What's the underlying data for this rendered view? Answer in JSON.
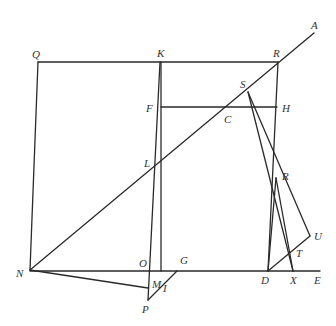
{
  "diagram": {
    "type": "geometric-construction",
    "points": {
      "Q": {
        "label": "Q",
        "x": 38,
        "y": 62
      },
      "K": {
        "label": "K",
        "x": 160,
        "y": 62
      },
      "R_top": {
        "label": "R",
        "x": 278,
        "y": 62
      },
      "A": {
        "label": "A",
        "x": 314,
        "y": 33
      },
      "F": {
        "label": "F",
        "x": 161,
        "y": 107
      },
      "H": {
        "label": "H",
        "x": 277,
        "y": 107
      },
      "C": {
        "label": "C",
        "x": 226,
        "y": 107
      },
      "S": {
        "label": "S",
        "x": 248,
        "y": 92
      },
      "L": {
        "label": "L",
        "x": 156,
        "y": 162
      },
      "R": {
        "label": "R",
        "x": 276,
        "y": 178
      },
      "U": {
        "label": "U",
        "x": 310,
        "y": 236
      },
      "T": {
        "label": "T",
        "x": 290,
        "y": 253
      },
      "N": {
        "label": "N",
        "x": 30,
        "y": 270
      },
      "O": {
        "label": "O",
        "x": 149,
        "y": 271
      },
      "G": {
        "label": "G",
        "x": 177,
        "y": 271
      },
      "D": {
        "label": "D",
        "x": 268,
        "y": 271
      },
      "X": {
        "label": "X",
        "x": 293,
        "y": 271
      },
      "E": {
        "label": "E",
        "x": 320,
        "y": 271
      },
      "M": {
        "label": "M",
        "x": 148,
        "y": 288
      },
      "I": {
        "label": "I",
        "x": 162,
        "y": 286
      },
      "P": {
        "label": "P",
        "x": 148,
        "y": 300
      }
    },
    "labels": [
      {
        "text": "Q",
        "x": 32,
        "y": 58
      },
      {
        "text": "K",
        "x": 157,
        "y": 57
      },
      {
        "text": "R",
        "x": 273,
        "y": 57
      },
      {
        "text": "A",
        "x": 311,
        "y": 29
      },
      {
        "text": "F",
        "x": 146,
        "y": 112
      },
      {
        "text": "S",
        "x": 240,
        "y": 88
      },
      {
        "text": "H",
        "x": 282,
        "y": 112
      },
      {
        "text": "C",
        "x": 224,
        "y": 123
      },
      {
        "text": "L",
        "x": 144,
        "y": 167
      },
      {
        "text": "R",
        "x": 282,
        "y": 180
      },
      {
        "text": "U",
        "x": 314,
        "y": 240
      },
      {
        "text": "T",
        "x": 296,
        "y": 257
      },
      {
        "text": "N",
        "x": 16,
        "y": 277
      },
      {
        "text": "O",
        "x": 139,
        "y": 267
      },
      {
        "text": "G",
        "x": 180,
        "y": 264
      },
      {
        "text": "M",
        "x": 152,
        "y": 288
      },
      {
        "text": "I",
        "x": 163,
        "y": 292
      },
      {
        "text": "D",
        "x": 261,
        "y": 284
      },
      {
        "text": "X",
        "x": 290,
        "y": 284
      },
      {
        "text": "E",
        "x": 314,
        "y": 284
      },
      {
        "text": "P",
        "x": 142,
        "y": 313
      }
    ],
    "segments": [
      {
        "name": "top-line-QR",
        "x1": 38,
        "y1": 62,
        "x2": 278,
        "y2": 62
      },
      {
        "name": "left-line-QN",
        "x1": 38,
        "y1": 62,
        "x2": 30,
        "y2": 270
      },
      {
        "name": "diagonal-NA",
        "x1": 30,
        "y1": 270,
        "x2": 314,
        "y2": 33
      },
      {
        "name": "baseline-NE",
        "x1": 30,
        "y1": 271,
        "x2": 320,
        "y2": 271
      },
      {
        "name": "line-FH",
        "x1": 161,
        "y1": 107,
        "x2": 277,
        "y2": 107
      },
      {
        "name": "line-K-down",
        "x1": 161,
        "y1": 62,
        "x2": 161,
        "y2": 271
      },
      {
        "name": "line-K-P",
        "x1": 160,
        "y1": 62,
        "x2": 148,
        "y2": 300
      },
      {
        "name": "line-R-D",
        "x1": 278,
        "y1": 62,
        "x2": 268,
        "y2": 271
      },
      {
        "name": "line-N-M",
        "x1": 30,
        "y1": 270,
        "x2": 148,
        "y2": 288
      },
      {
        "name": "line-P-G",
        "x1": 148,
        "y1": 300,
        "x2": 177,
        "y2": 271
      },
      {
        "name": "line-S-U",
        "x1": 248,
        "y1": 92,
        "x2": 310,
        "y2": 236
      },
      {
        "name": "line-S-X",
        "x1": 248,
        "y1": 92,
        "x2": 293,
        "y2": 271
      },
      {
        "name": "line-R-X",
        "x1": 276,
        "y1": 178,
        "x2": 293,
        "y2": 271
      },
      {
        "name": "line-D-U",
        "x1": 268,
        "y1": 271,
        "x2": 310,
        "y2": 236
      },
      {
        "name": "line-R-D2",
        "x1": 276,
        "y1": 178,
        "x2": 268,
        "y2": 271
      }
    ]
  }
}
